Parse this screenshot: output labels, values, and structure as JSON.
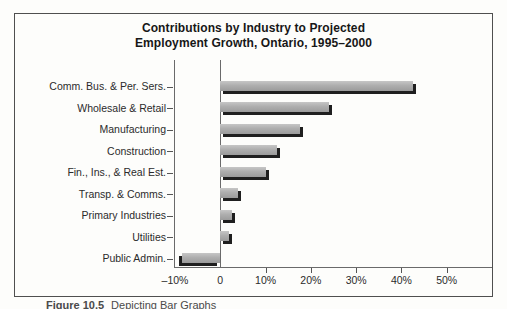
{
  "figure": {
    "title_line1": "Contributions by Industry to Projected",
    "title_line2": "Employment Growth, Ontario, 1995–2000",
    "caption_label": "Figure 10.5",
    "caption_text": "Depicting Bar Graphs"
  },
  "chart_data": {
    "type": "bar",
    "orientation": "horizontal",
    "title": "Contributions by Industry to Projected Employment Growth, Ontario, 1995–2000",
    "categories": [
      "Comm. Bus. & Per. Sers.",
      "Wholesale & Retail",
      "Manufacturing",
      "Construction",
      "Fin., Ins., & Real Est.",
      "Transp. & Comms.",
      "Primary Industries",
      "Utilities",
      "Public Admin."
    ],
    "values": [
      42.5,
      24,
      17.5,
      12.5,
      10,
      4,
      2.5,
      2,
      -8.5
    ],
    "unit": "%",
    "xlabel": "",
    "ylabel": "",
    "xlim": [
      -10,
      60
    ],
    "x_ticks": [
      {
        "value": -10,
        "label": "–10%"
      },
      {
        "value": 0,
        "label": "0"
      },
      {
        "value": 10,
        "label": "10%"
      },
      {
        "value": 20,
        "label": "20%"
      },
      {
        "value": 30,
        "label": "30%"
      },
      {
        "value": 40,
        "label": "40%"
      },
      {
        "value": 50,
        "label": "50%"
      }
    ],
    "grid": false,
    "legend": false,
    "colors": {
      "bar_fill": "#a9a9a9",
      "bar_shadow": "#1f1f1f",
      "axis": "#6a6a6a",
      "frame_border": "#4f4f4f",
      "background": "#fdfdfb"
    }
  }
}
